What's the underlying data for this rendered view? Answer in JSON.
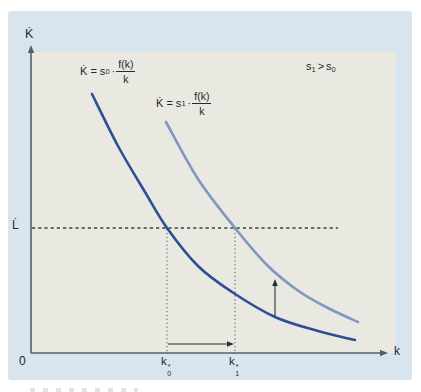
{
  "labels": {
    "y_axis": "K̇",
    "x_axis": "k",
    "origin": "0",
    "l_dot": "L̇"
  },
  "ticks": {
    "k0": {
      "base": "k",
      "sup": "*",
      "sub": "0"
    },
    "k1": {
      "base": "k",
      "sup": "*",
      "sub": "1"
    }
  },
  "equations": {
    "curve0": {
      "lhs": "K̇ = s",
      "sub": "0",
      "times": "·",
      "numerator": "f(k)",
      "denominator": "k"
    },
    "curve1": {
      "lhs": "K̇ = s",
      "sub": "1",
      "times": "·",
      "numerator": "f(k)",
      "denominator": "k"
    }
  },
  "annotation": {
    "s1_base": "s",
    "s1_sub": "1",
    "op": ">",
    "s0_base": "s",
    "s0_sub": "0"
  },
  "chart_data": {
    "type": "line",
    "title": "",
    "x_axis_label": "k",
    "y_axis_label": "K̇",
    "numeric_scale": false,
    "annotation_text": "s1 > s0",
    "x_ticks": [
      {
        "label": "k0*",
        "x_px": 167
      },
      {
        "label": "k1*",
        "x_px": 235
      }
    ],
    "y_levels": [
      {
        "label": "L̇",
        "y_px": 228,
        "style": "dashed",
        "x_end_px": 338
      }
    ],
    "series": [
      {
        "name": "K̇ = s0·f(k)/k",
        "color": "#2d4f96",
        "width": 2.6,
        "points_px": [
          [
            92,
            94
          ],
          [
            118,
            146
          ],
          [
            145,
            192
          ],
          [
            167,
            228
          ],
          [
            198,
            266
          ],
          [
            232,
            292
          ],
          [
            275,
            317
          ],
          [
            318,
            331
          ],
          [
            355,
            340
          ]
        ]
      },
      {
        "name": "K̇ = s1·f(k)/k",
        "color": "#8196c0",
        "width": 2.6,
        "points_px": [
          [
            166,
            122
          ],
          [
            198,
            179
          ],
          [
            235,
            228
          ],
          [
            268,
            266
          ],
          [
            300,
            292
          ],
          [
            330,
            309
          ],
          [
            358,
            322
          ]
        ]
      }
    ],
    "arrows_px": {
      "horizontal": {
        "x1": 168,
        "x2": 234,
        "y": 344
      },
      "vertical": {
        "x": 275,
        "y1": 316,
        "y2": 279
      }
    },
    "axes_px": {
      "origin": [
        31,
        353
      ],
      "x_end": 388,
      "y_end": 45,
      "plot_right": 395,
      "plot_top": 52
    },
    "colors": {
      "card_bg": "#d8e5ef",
      "plot_bg": "#e9e9e1",
      "axis": "#595e63",
      "guide": "#3c4046",
      "dotted_guide": "#55595e",
      "arrow": "#2b2e33",
      "text": "#26282c"
    }
  }
}
